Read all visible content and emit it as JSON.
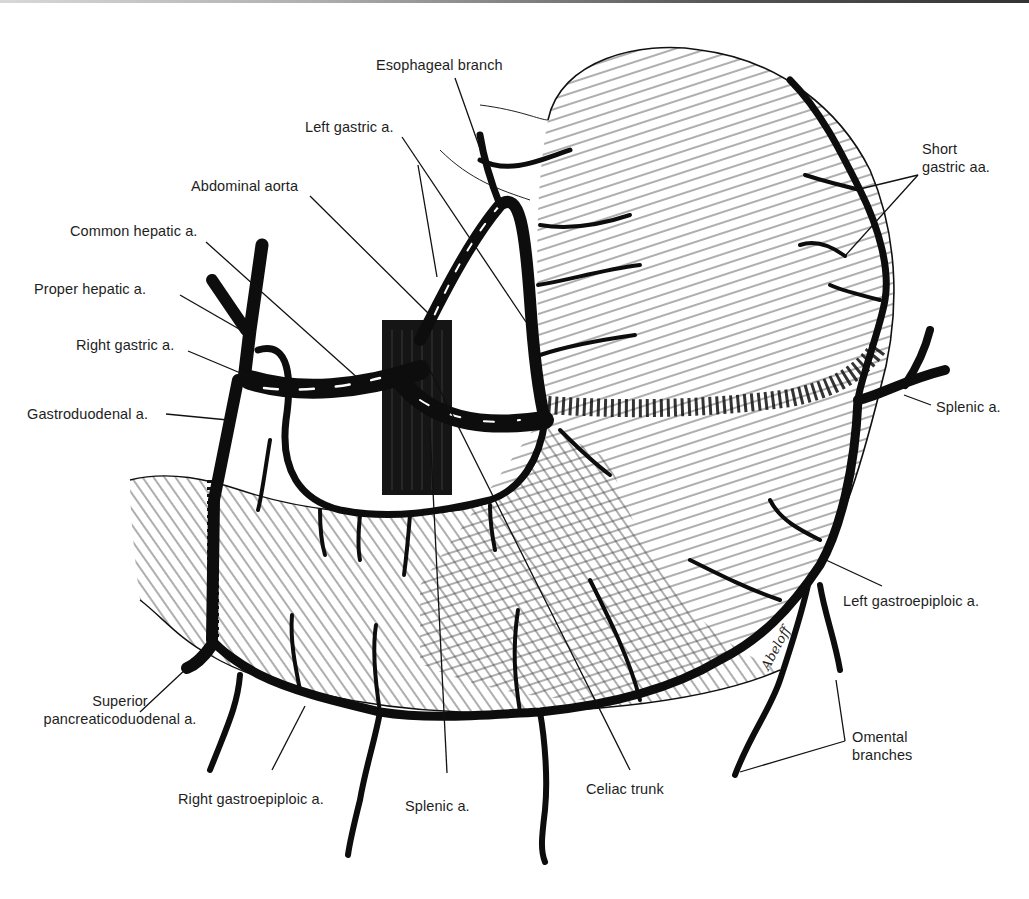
{
  "figure": {
    "signature": "Abeloff",
    "colors": {
      "ink": "#111111",
      "background": "#ffffff",
      "label": "#1e1e1e"
    }
  },
  "labels": {
    "esophageal_branch": "Esophageal branch",
    "left_gastric": "Left gastric a.",
    "abdominal_aorta": "Abdominal aorta",
    "common_hepatic": "Common hepatic a.",
    "proper_hepatic": "Proper hepatic a.",
    "right_gastric": "Right gastric a.",
    "gastroduodenal": "Gastroduodenal a.",
    "short_gastric_line1": "Short",
    "short_gastric_line2": "gastric aa.",
    "splenic_right": "Splenic a.",
    "left_gastroepiploic": "Left gastroepiploic a.",
    "omental_line1": "Omental",
    "omental_line2": "branches",
    "superior_pd_line1": "Superior",
    "superior_pd_line2": "pancreaticoduodenal a.",
    "right_gastroepiploic": "Right gastroepiploic a.",
    "splenic_bottom": "Splenic a.",
    "celiac_trunk": "Celiac trunk"
  },
  "leaders": [
    {
      "name": "esophageal-branch-leader",
      "x1": 455,
      "y1": 78,
      "x2": 484,
      "y2": 160
    },
    {
      "name": "left-gastric-leader-a",
      "x1": 402,
      "y1": 137,
      "x2": 526,
      "y2": 322
    },
    {
      "name": "left-gastric-leader-b",
      "x1": 418,
      "y1": 165,
      "x2": 437,
      "y2": 277
    },
    {
      "name": "abdominal-aorta-leader",
      "x1": 310,
      "y1": 196,
      "x2": 428,
      "y2": 313
    },
    {
      "name": "common-hepatic-leader",
      "x1": 206,
      "y1": 242,
      "x2": 360,
      "y2": 380
    },
    {
      "name": "proper-hepatic-leader",
      "x1": 180,
      "y1": 295,
      "x2": 246,
      "y2": 333
    },
    {
      "name": "right-gastric-leader",
      "x1": 188,
      "y1": 351,
      "x2": 250,
      "y2": 377
    },
    {
      "name": "gastroduodenal-leader",
      "x1": 166,
      "y1": 414,
      "x2": 228,
      "y2": 420
    },
    {
      "name": "short-gastric-leader-a",
      "x1": 918,
      "y1": 175,
      "x2": 860,
      "y2": 189
    },
    {
      "name": "short-gastric-leader-b",
      "x1": 918,
      "y1": 175,
      "x2": 845,
      "y2": 256
    },
    {
      "name": "splenic-right-leader",
      "x1": 931,
      "y1": 405,
      "x2": 904,
      "y2": 395
    },
    {
      "name": "left-gastroepiploic-leader",
      "x1": 882,
      "y1": 586,
      "x2": 826,
      "y2": 560
    },
    {
      "name": "omental-leader-a",
      "x1": 845,
      "y1": 741,
      "x2": 740,
      "y2": 772
    },
    {
      "name": "omental-leader-b",
      "x1": 845,
      "y1": 741,
      "x2": 836,
      "y2": 680
    },
    {
      "name": "superior-pd-leader",
      "x1": 140,
      "y1": 712,
      "x2": 187,
      "y2": 668
    },
    {
      "name": "right-gastroepiploic-leader",
      "x1": 272,
      "y1": 770,
      "x2": 305,
      "y2": 706
    },
    {
      "name": "splenic-bottom-leader",
      "x1": 447,
      "y1": 773,
      "x2": 430,
      "y2": 430
    },
    {
      "name": "celiac-trunk-leader",
      "x1": 630,
      "y1": 770,
      "x2": 425,
      "y2": 360
    }
  ]
}
